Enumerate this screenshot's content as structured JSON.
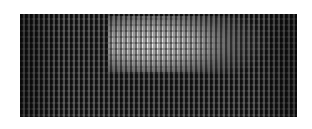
{
  "image": {
    "description": "Close-up texture of a dark grid/mesh pattern with a bright rectangular highlight in the upper center",
    "colors": {
      "background": "#ffffff",
      "mesh_dark": "#1a1a1a",
      "mesh_gap": "#787878",
      "highlight": "#f5f5f5"
    }
  }
}
